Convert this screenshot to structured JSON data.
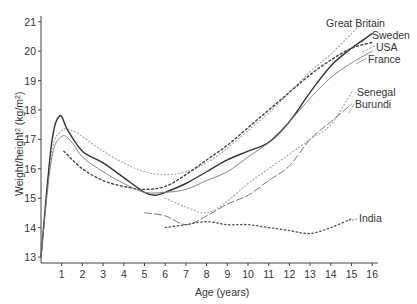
{
  "chart_data": {
    "type": "line",
    "title": "",
    "xlabel": "Age (years)",
    "ylabel": "Weight/height² (kg/m²)",
    "xlim": [
      0,
      16
    ],
    "ylim": [
      13,
      21
    ],
    "x_ticks": [
      1,
      2,
      3,
      4,
      5,
      6,
      7,
      8,
      9,
      10,
      11,
      12,
      13,
      14,
      15,
      16
    ],
    "y_ticks": [
      13,
      14,
      15,
      16,
      17,
      18,
      19,
      20,
      21
    ],
    "grid": false,
    "legend": "inline labels at line ends",
    "series": [
      {
        "name": "Great Britain",
        "style": "dotted-light",
        "x": [
          0,
          0.5,
          1,
          1.5,
          2,
          3,
          4,
          5,
          6,
          7,
          8,
          9,
          10,
          11,
          12,
          13,
          14,
          15,
          15.5
        ],
        "y": [
          13.0,
          16.5,
          17.3,
          17.3,
          17.1,
          16.6,
          16.2,
          15.9,
          15.8,
          15.9,
          16.2,
          16.7,
          17.3,
          17.9,
          18.6,
          19.3,
          19.9,
          20.6,
          21.0
        ]
      },
      {
        "name": "Sweden",
        "style": "solid-dark",
        "x": [
          0,
          0.5,
          0.9,
          1.3,
          2,
          3,
          4,
          5,
          5.5,
          6,
          7,
          8,
          9,
          10,
          11,
          12,
          13,
          14,
          15,
          16
        ],
        "y": [
          13.0,
          16.8,
          17.8,
          17.3,
          16.6,
          16.2,
          15.7,
          15.2,
          15.1,
          15.2,
          15.5,
          15.9,
          16.3,
          16.6,
          16.9,
          17.6,
          18.6,
          19.5,
          20.1,
          20.6
        ]
      },
      {
        "name": "USA",
        "style": "dashed-dark",
        "x": [
          1.1,
          2,
          3,
          4,
          5,
          6,
          7,
          8,
          9,
          10,
          11,
          12,
          13,
          14,
          15,
          16
        ],
        "y": [
          16.6,
          16.0,
          15.6,
          15.4,
          15.3,
          15.4,
          15.8,
          16.3,
          16.8,
          17.4,
          18.0,
          18.6,
          19.2,
          19.7,
          20.1,
          20.3
        ]
      },
      {
        "name": "France",
        "style": "solid-light",
        "x": [
          0,
          0.5,
          1,
          1.5,
          2,
          3,
          4,
          5,
          6,
          7,
          8,
          9,
          10,
          11,
          12,
          13,
          14,
          15,
          16
        ],
        "y": [
          13.0,
          16.3,
          17.1,
          16.9,
          16.4,
          15.9,
          15.5,
          15.2,
          15.2,
          15.3,
          15.6,
          15.9,
          16.4,
          16.9,
          17.6,
          18.4,
          19.1,
          19.6,
          20.0
        ]
      },
      {
        "name": "Senegal",
        "style": "dotted-light",
        "x": [
          6,
          7,
          8,
          9,
          10,
          11,
          12,
          13,
          14,
          15
        ],
        "y": [
          15.0,
          14.7,
          14.5,
          14.9,
          15.5,
          16.0,
          16.5,
          17.0,
          17.5,
          18.6
        ]
      },
      {
        "name": "Burundi",
        "style": "long-dash",
        "x": [
          5,
          6,
          7,
          8,
          9,
          10,
          11,
          12,
          13,
          14,
          15
        ],
        "y": [
          14.5,
          14.4,
          14.1,
          14.4,
          14.8,
          15.1,
          15.6,
          16.1,
          17.0,
          17.6,
          18.2
        ]
      },
      {
        "name": "India",
        "style": "dotted-dark",
        "x": [
          6,
          7,
          8,
          9,
          10,
          11,
          12,
          13,
          14,
          15
        ],
        "y": [
          14.0,
          14.1,
          14.2,
          14.1,
          14.1,
          14.0,
          13.9,
          13.8,
          14.0,
          14.3
        ]
      }
    ]
  },
  "labels": {
    "great_britain": "Great Britain",
    "sweden": "Sweden",
    "usa": "USA",
    "france": "France",
    "senegal": "Senegal",
    "burundi": "Burundi",
    "india": "India",
    "x_title": "Age (years)",
    "y_title_main": "Weight/height",
    "y_title_sup": "2",
    "y_title_unit": " (kg/m",
    "y_title_unit_sup": "2",
    "y_title_close": ")"
  }
}
